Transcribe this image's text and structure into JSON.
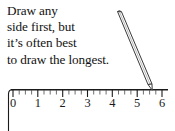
{
  "figure": {
    "kind": "number-line-with-pencil-illustration",
    "background_color": "#ffffff",
    "ink_color": "#1a1a1a",
    "width": 175,
    "height": 131
  },
  "caption": {
    "lines": [
      "Draw any",
      "side first, but",
      "it’s often best",
      "to draw the longest."
    ]
  },
  "ruler": {
    "axis_label": "number-line",
    "tick_labels": [
      "0",
      "1",
      "2",
      "3",
      "4",
      "5",
      "6"
    ],
    "minor_ticks_per_unit": 4,
    "min": 0,
    "max": 6,
    "line_color": "#1a1a1a"
  },
  "pencil": {
    "label": "pencil",
    "tip_value": 5.6,
    "outline_color": "#3a3a3a"
  }
}
